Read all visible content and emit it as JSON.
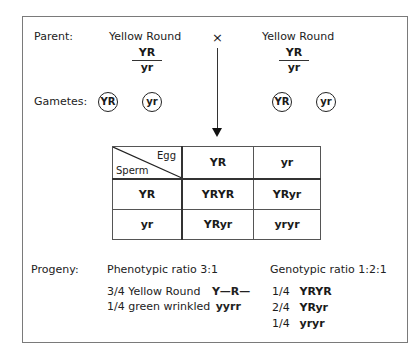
{
  "parent": {
    "label": "Parent:",
    "left": {
      "phenotype": "Yellow Round",
      "genotype_top": "YR",
      "genotype_bottom": "yr"
    },
    "cross_symbol": "×",
    "right": {
      "phenotype": "Yellow Round",
      "genotype_top": "YR",
      "genotype_bottom": "yr"
    }
  },
  "gametes": {
    "label": "Gametes:",
    "left": [
      "YR",
      "yr"
    ],
    "right": [
      "YR",
      "yr"
    ]
  },
  "punnett": {
    "corner_egg": "Egg",
    "corner_sperm": "Sperm",
    "egg_headers": [
      "YR",
      "yr"
    ],
    "rows": [
      {
        "sperm": "YR",
        "cells": [
          "YRYR",
          "YRyr"
        ]
      },
      {
        "sperm": "yr",
        "cells": [
          "YRyr",
          "yryr"
        ]
      }
    ]
  },
  "progeny": {
    "label": "Progeny:",
    "phenotypic": {
      "title": "Phenotypic ratio 3:1",
      "items": [
        {
          "text": "3/4 Yellow Round",
          "genotype": "Y—R—"
        },
        {
          "text": "1/4 green wrinkled",
          "genotype": "yyrr"
        }
      ]
    },
    "genotypic": {
      "title": "Genotypic ratio 1:2:1",
      "items": [
        {
          "fraction": "1/4",
          "genotype": "YRYR"
        },
        {
          "fraction": "2/4",
          "genotype": "YRyr"
        },
        {
          "fraction": "1/4",
          "genotype": "yryr"
        }
      ]
    }
  }
}
